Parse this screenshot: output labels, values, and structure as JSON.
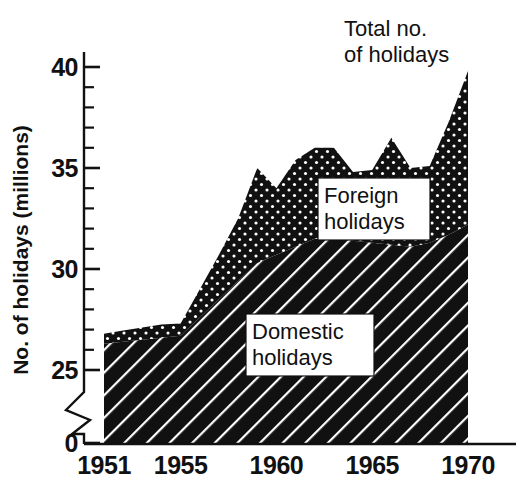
{
  "chart_data": {
    "type": "area",
    "title": "",
    "subtitle": "",
    "xlabel": "",
    "ylabel": "No. of holidays (millions)",
    "xlim": [
      1951,
      1970
    ],
    "ylim": [
      0,
      41
    ],
    "y_axis_break": {
      "from": 0,
      "to": 24,
      "note": "broken axis between 0 and 25"
    },
    "grid": false,
    "legend_position": "inline-annotations",
    "x_tick_labels": [
      "1951",
      "1955",
      "1960",
      "1965",
      "1970"
    ],
    "x_tick_values": [
      1951,
      1955,
      1960,
      1965,
      1970
    ],
    "y_tick_labels": [
      "0",
      "25",
      "30",
      "35",
      "40"
    ],
    "y_tick_values": [
      0,
      25,
      30,
      35,
      40
    ],
    "y_minor_tick_step": 1,
    "x": [
      1951,
      1952,
      1953,
      1954,
      1955,
      1956,
      1957,
      1958,
      1959,
      1960,
      1961,
      1962,
      1963,
      1964,
      1965,
      1966,
      1967,
      1968,
      1969,
      1970
    ],
    "categories": [
      "1951",
      "1952",
      "1953",
      "1954",
      "1955",
      "1956",
      "1957",
      "1958",
      "1959",
      "1960",
      "1961",
      "1962",
      "1963",
      "1964",
      "1965",
      "1966",
      "1967",
      "1968",
      "1969",
      "1970"
    ],
    "series": [
      {
        "name": "Domestic holidays",
        "fill_pattern": "diagonal-hatch",
        "color": "#111111",
        "values": [
          26.3,
          26.4,
          26.5,
          26.6,
          26.7,
          27.6,
          28.5,
          29.4,
          30.3,
          30.7,
          31.1,
          31.5,
          31.5,
          31.4,
          31.3,
          31.2,
          31.1,
          31.3,
          31.7,
          32.2
        ]
      },
      {
        "name": "Foreign holidays",
        "fill_pattern": "dotted",
        "color": "#111111",
        "values": [
          0.5,
          0.55,
          0.6,
          0.65,
          0.6,
          1.4,
          2.2,
          3.1,
          4.7,
          3.3,
          4.3,
          4.5,
          4.5,
          3.4,
          3.6,
          5.3,
          3.9,
          3.8,
          5.6,
          7.6
        ]
      }
    ],
    "total_series": {
      "name": "Total no. of holidays",
      "values": [
        26.8,
        26.95,
        27.1,
        27.25,
        27.3,
        29.0,
        30.7,
        32.5,
        35.0,
        34.0,
        35.4,
        36.0,
        36.0,
        34.8,
        34.9,
        36.5,
        35.0,
        35.1,
        37.3,
        39.8
      ]
    },
    "annotations": [
      {
        "id": "total-annotation",
        "text_lines": [
          "Total no.",
          "of holidays"
        ],
        "target_year": 1970,
        "target_value": 39.8
      },
      {
        "id": "foreign-label",
        "text_lines": [
          "Foreign",
          "holidays"
        ],
        "boxed": true
      },
      {
        "id": "domestic-label",
        "text_lines": [
          "Domestic",
          "holidays"
        ],
        "boxed": true
      }
    ]
  },
  "axis": {
    "y_title": "No. of holidays (millions)",
    "y_labels": [
      "40",
      "35",
      "30",
      "25",
      "0"
    ],
    "x_labels": [
      "1951",
      "1955",
      "1960",
      "1965",
      "1970"
    ]
  },
  "labels": {
    "total_line1": "Total no.",
    "total_line2": "of holidays",
    "foreign_line1": "Foreign",
    "foreign_line2": "holidays",
    "domestic_line1": "Domestic",
    "domestic_line2": "holidays"
  },
  "colors": {
    "ink": "#111111",
    "background": "#ffffff",
    "fill": "#111111",
    "pattern_highlight": "#ffffff"
  }
}
